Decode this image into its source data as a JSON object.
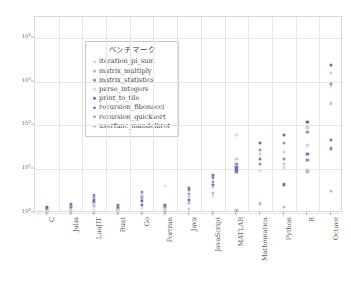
{
  "chart_data": {
    "type": "scatter",
    "title": "",
    "xlabel": "",
    "ylabel": "",
    "grid": true,
    "legend_position": "upper-left-inside",
    "yscale": "log",
    "ylim": [
      1,
      30000
    ],
    "yticks": [
      {
        "value": 1,
        "label": "10",
        "exp": "0"
      },
      {
        "value": 10,
        "label": "10",
        "exp": "1"
      },
      {
        "value": 100,
        "label": "10",
        "exp": "2"
      },
      {
        "value": 1000,
        "label": "10",
        "exp": "3"
      },
      {
        "value": 10000,
        "label": "10",
        "exp": "4"
      }
    ],
    "categories": [
      "C",
      "Julia",
      "LuaJIT",
      "Rust",
      "Go",
      "Fortran",
      "Java",
      "JavaScript",
      "MATLAB",
      "Mathematica",
      "Python",
      "R",
      "Octave"
    ],
    "legend_title": "ベンチマーク",
    "series": [
      {
        "name": "iteration_pi_sum",
        "color": "#c9c4e2",
        "points": [
          {
            "x": "C",
            "y": 1.0
          },
          {
            "x": "Julia",
            "y": 1.0
          },
          {
            "x": "LuaJIT",
            "y": 1.0
          },
          {
            "x": "Rust",
            "y": 1.0
          },
          {
            "x": "Go",
            "y": 1.0
          },
          {
            "x": "Fortran",
            "y": 1.0
          },
          {
            "x": "Java",
            "y": 1.25
          },
          {
            "x": "JavaScript",
            "y": 1.05
          },
          {
            "x": "MATLAB",
            "y": 1.2
          },
          {
            "x": "Mathematica",
            "y": 1.7
          },
          {
            "x": "Python",
            "y": 13.0
          },
          {
            "x": "R",
            "y": 9.5
          },
          {
            "x": "Octave",
            "y": 320.0
          }
        ]
      },
      {
        "name": "matrix_multiply",
        "color": "#b9b5d8",
        "points": [
          {
            "x": "C",
            "y": 1.05
          },
          {
            "x": "Julia",
            "y": 1.1
          },
          {
            "x": "LuaJIT",
            "y": 1.45
          },
          {
            "x": "Rust",
            "y": 1.15
          },
          {
            "x": "Go",
            "y": 2.1
          },
          {
            "x": "Fortran",
            "y": 1.1
          },
          {
            "x": "Java",
            "y": 1.7
          },
          {
            "x": "JavaScript",
            "y": 2.9
          },
          {
            "x": "MATLAB",
            "y": 1.1
          },
          {
            "x": "Mathematica",
            "y": 1.6
          },
          {
            "x": "Python",
            "y": 1.35
          },
          {
            "x": "R",
            "y": 8.5
          },
          {
            "x": "Octave",
            "y": 3.2
          }
        ]
      },
      {
        "name": "matrix_statistics",
        "color": "#8f88bd",
        "points": [
          {
            "x": "C",
            "y": 1.25
          },
          {
            "x": "Julia",
            "y": 1.5
          },
          {
            "x": "LuaJIT",
            "y": 2.6
          },
          {
            "x": "Rust",
            "y": 1.4
          },
          {
            "x": "Go",
            "y": 3.0
          },
          {
            "x": "Fortran",
            "y": 1.3
          },
          {
            "x": "Java",
            "y": 3.4
          },
          {
            "x": "JavaScript",
            "y": 6.5
          },
          {
            "x": "MATLAB",
            "y": 8.5
          },
          {
            "x": "Mathematica",
            "y": 13.0
          },
          {
            "x": "Python",
            "y": 17.0
          },
          {
            "x": "R",
            "y": 16.0
          },
          {
            "x": "Octave",
            "y": 30.0
          }
        ]
      },
      {
        "name": "parse_integers",
        "color": "#ddd9ec",
        "points": [
          {
            "x": "C",
            "y": 1.15
          },
          {
            "x": "Julia",
            "y": 1.25
          },
          {
            "x": "LuaJIT",
            "y": 1.2
          },
          {
            "x": "Rust",
            "y": 1.1
          },
          {
            "x": "Go",
            "y": 1.3
          },
          {
            "x": "Fortran",
            "y": 4.2
          },
          {
            "x": "Java",
            "y": 2.3
          },
          {
            "x": "JavaScript",
            "y": 2.5
          },
          {
            "x": "MATLAB",
            "y": 60.0
          },
          {
            "x": "Mathematica",
            "y": 9.0
          },
          {
            "x": "Python",
            "y": 11.0
          },
          {
            "x": "R",
            "y": 35.0
          },
          {
            "x": "Octave",
            "y": 800.0
          }
        ]
      },
      {
        "name": "print_to_tile",
        "color": "#7b73b0",
        "points": [
          {
            "x": "C",
            "y": 1.3
          },
          {
            "x": "Julia",
            "y": 1.6
          },
          {
            "x": "LuaJIT",
            "y": 1.75
          },
          {
            "x": "Rust",
            "y": 1.55
          },
          {
            "x": "Go",
            "y": 1.5
          },
          {
            "x": "Fortran",
            "y": 1.45
          },
          {
            "x": "Java",
            "y": 3.8
          },
          {
            "x": "JavaScript",
            "y": 7.5
          },
          {
            "x": "MATLAB",
            "y": 11.0
          },
          {
            "x": "Mathematica",
            "y": 17.0
          },
          {
            "x": "Python",
            "y": 4.5
          },
          {
            "x": "R",
            "y": 22.0
          },
          {
            "x": "Octave",
            "y": 46.0
          }
        ]
      },
      {
        "name": "recursion_fibonacci",
        "color": "#6f67a8",
        "points": [
          {
            "x": "C",
            "y": 1.4
          },
          {
            "x": "Julia",
            "y": 1.35
          },
          {
            "x": "LuaJIT",
            "y": 2.0
          },
          {
            "x": "Rust",
            "y": 1.3
          },
          {
            "x": "Go",
            "y": 1.9
          },
          {
            "x": "Fortran",
            "y": 1.55
          },
          {
            "x": "Java",
            "y": 2.0
          },
          {
            "x": "JavaScript",
            "y": 4.4
          },
          {
            "x": "MATLAB",
            "y": 9.5
          },
          {
            "x": "Mathematica",
            "y": 40.0
          },
          {
            "x": "Python",
            "y": 60.0
          },
          {
            "x": "R",
            "y": 120.0
          },
          {
            "x": "Octave",
            "y": 2400.0
          }
        ]
      },
      {
        "name": "recursion_quicksort",
        "color": "#9a93c6",
        "points": [
          {
            "x": "C",
            "y": 1.2
          },
          {
            "x": "Julia",
            "y": 1.45
          },
          {
            "x": "LuaJIT",
            "y": 2.3
          },
          {
            "x": "Rust",
            "y": 1.25
          },
          {
            "x": "Go",
            "y": 2.4
          },
          {
            "x": "Fortran",
            "y": 1.35
          },
          {
            "x": "Java",
            "y": 2.7
          },
          {
            "x": "JavaScript",
            "y": 5.2
          },
          {
            "x": "MATLAB",
            "y": 13.0
          },
          {
            "x": "Mathematica",
            "y": 28.0
          },
          {
            "x": "Python",
            "y": 40.0
          },
          {
            "x": "R",
            "y": 70.0
          },
          {
            "x": "Octave",
            "y": 900.0
          }
        ]
      },
      {
        "name": "userfunc_mandelbrot",
        "color": "#cdc8e6",
        "points": [
          {
            "x": "C",
            "y": 1.1
          },
          {
            "x": "Julia",
            "y": 1.2
          },
          {
            "x": "LuaJIT",
            "y": 1.6
          },
          {
            "x": "Rust",
            "y": 1.2
          },
          {
            "x": "Go",
            "y": 2.6
          },
          {
            "x": "Fortran",
            "y": 1.25
          },
          {
            "x": "Java",
            "y": 2.5
          },
          {
            "x": "JavaScript",
            "y": 4.0
          },
          {
            "x": "MATLAB",
            "y": 17.0
          },
          {
            "x": "Mathematica",
            "y": 22.0
          },
          {
            "x": "Python",
            "y": 25.0
          },
          {
            "x": "R",
            "y": 90.0
          },
          {
            "x": "Octave",
            "y": 1600.0
          }
        ]
      }
    ]
  }
}
